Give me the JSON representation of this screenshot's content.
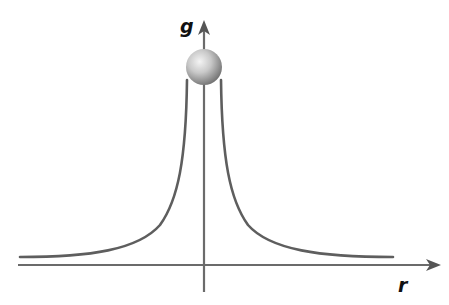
{
  "diagram": {
    "axes": {
      "y_label": "g",
      "x_label": "r"
    },
    "elements": {
      "sphere": "mass-sphere",
      "curve_left": "field-curve-left",
      "curve_right": "field-curve-right"
    },
    "colors": {
      "axis": "#6b6b6b",
      "curve": "#5e5e5e",
      "sphere_light": "#e8e8e8",
      "sphere_dark": "#7a7a7a"
    }
  }
}
